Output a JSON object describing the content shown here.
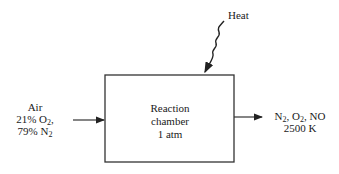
{
  "diagram": {
    "heat_label": "Heat",
    "inlet": {
      "line1": "Air",
      "line2_prefix": "21% O",
      "line2_sub": "2",
      "line2_suffix": ",",
      "line3_prefix": "79% N",
      "line3_sub": "2"
    },
    "chamber": {
      "line1": "Reaction",
      "line2": "chamber",
      "line3": "1 atm"
    },
    "outlet": {
      "n": "N",
      "n_sub": "2",
      "sep1": ", O",
      "o_sub": "2",
      "sep2": ", NO",
      "line2": "2500 K"
    },
    "colors": {
      "line": "#333333",
      "text": "#1a1a1a"
    }
  }
}
